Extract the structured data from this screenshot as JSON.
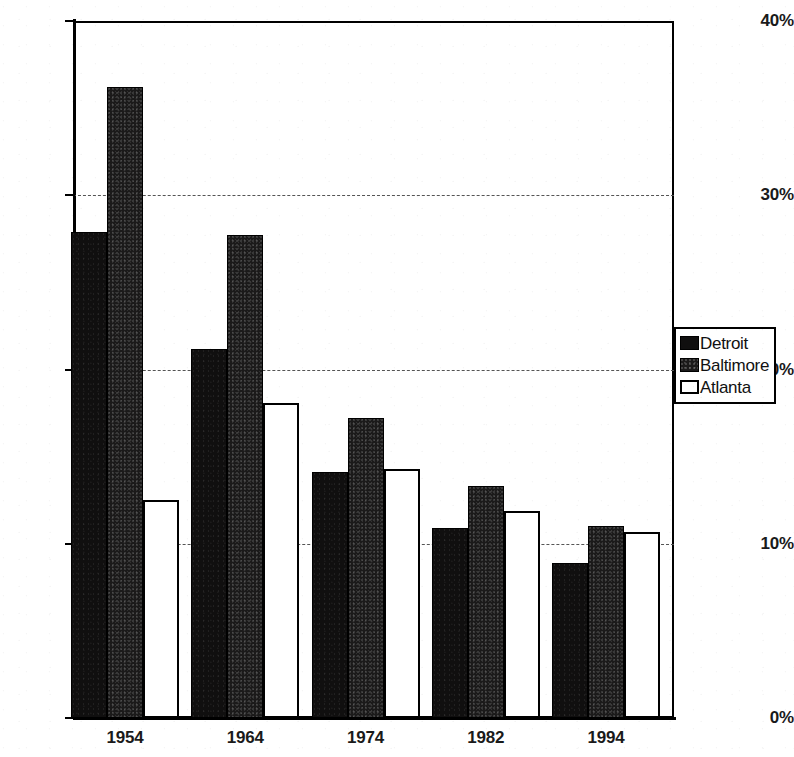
{
  "chart_data": {
    "type": "bar",
    "title": "",
    "subtitle": "",
    "xlabel": "",
    "ylabel": "",
    "categories": [
      "1954",
      "1964",
      "1974",
      "1982",
      "1994"
    ],
    "series": [
      {
        "name": "Detroit",
        "values": [
          27.9,
          21.2,
          14.1,
          10.9,
          8.9
        ],
        "style": "solid-black"
      },
      {
        "name": "Baltimore",
        "values": [
          36.2,
          27.7,
          17.2,
          13.3,
          11.0
        ],
        "style": "dark-textured"
      },
      {
        "name": "Atlanta",
        "values": [
          12.5,
          18.1,
          14.3,
          11.9,
          10.7
        ],
        "style": "white-outlined"
      }
    ],
    "ylim": [
      0,
      40
    ],
    "yticks": [
      0,
      10,
      20,
      30,
      40
    ],
    "ytick_labels": [
      "0%",
      "10%",
      "20%",
      "30%",
      "40%"
    ],
    "grid": "horizontal-dashed",
    "gridlines_at": [
      10,
      20,
      30
    ],
    "legend_position": "right",
    "value_format": "percent"
  },
  "legend": {
    "entries": [
      {
        "label": "Detroit",
        "swatch": "legend-swatch-detroit"
      },
      {
        "label": "Baltimore",
        "swatch": "legend-swatch-baltimore"
      },
      {
        "label": "Atlanta",
        "swatch": "legend-swatch-atlanta"
      }
    ]
  },
  "colors": {
    "detroit": "#100f0f",
    "baltimore": "#1b1a1a",
    "atlanta": "#ffffff",
    "axis": "#000000",
    "grid": "#555555",
    "text": "#1a1a1a",
    "background": "#ffffff"
  }
}
